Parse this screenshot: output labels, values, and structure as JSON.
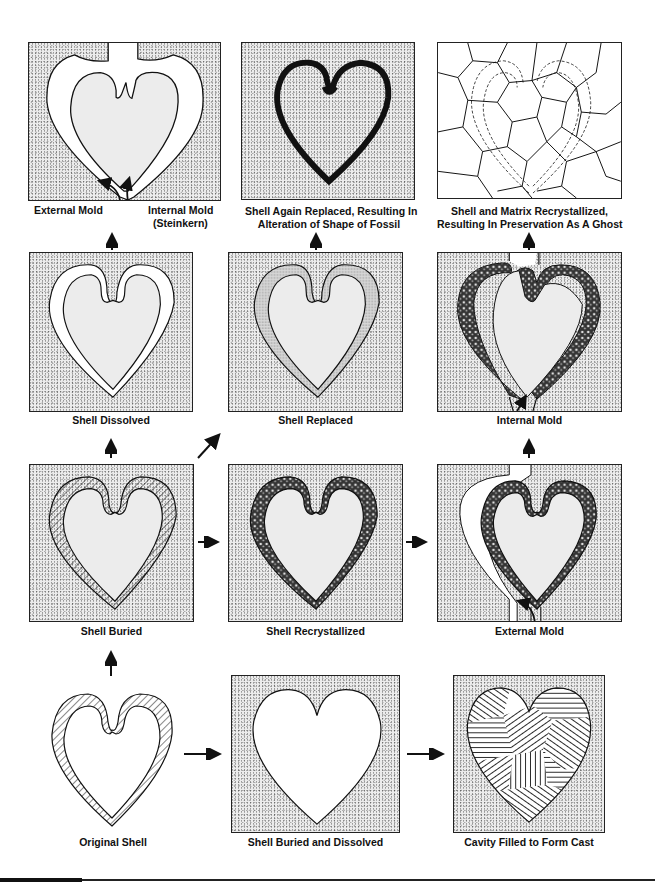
{
  "diagram": {
    "panels": [
      {
        "id": "external-internal-mold",
        "row": 1,
        "col": 1,
        "label_left": "External Mold",
        "label_right_line1": "Internal Mold",
        "label_right_line2": "(Steinkern)"
      },
      {
        "id": "shell-again-replaced",
        "row": 1,
        "col": 2,
        "label_line1": "Shell Again Replaced, Resulting In",
        "label_line2": "Alteration of Shape of Fossil"
      },
      {
        "id": "matrix-recrystallized",
        "row": 1,
        "col": 3,
        "label_line1": "Shell and Matrix Recrystallized,",
        "label_line2": "Resulting In Preservation As A Ghost"
      },
      {
        "id": "shell-dissolved",
        "row": 2,
        "col": 1,
        "label": "Shell Dissolved"
      },
      {
        "id": "shell-replaced",
        "row": 2,
        "col": 2,
        "label": "Shell Replaced"
      },
      {
        "id": "internal-mold",
        "row": 2,
        "col": 3,
        "label": "Internal Mold"
      },
      {
        "id": "shell-buried",
        "row": 3,
        "col": 1,
        "label": "Shell Buried"
      },
      {
        "id": "shell-recrystallized",
        "row": 3,
        "col": 2,
        "label": "Shell Recrystallized"
      },
      {
        "id": "external-mold",
        "row": 3,
        "col": 3,
        "label": "External Mold"
      },
      {
        "id": "original-shell",
        "row": 4,
        "col": 1,
        "label": "Original Shell"
      },
      {
        "id": "shell-buried-dissolved",
        "row": 4,
        "col": 2,
        "label": "Shell Buried and Dissolved"
      },
      {
        "id": "cavity-filled-cast",
        "row": 4,
        "col": 3,
        "label": "Cavity Filled to Form Cast"
      }
    ],
    "arrows": [
      {
        "from": "original-shell",
        "to": "shell-buried",
        "direction": "up"
      },
      {
        "from": "original-shell",
        "to": "shell-buried-dissolved",
        "direction": "right"
      },
      {
        "from": "shell-buried-dissolved",
        "to": "cavity-filled-cast",
        "direction": "right"
      },
      {
        "from": "shell-buried",
        "to": "shell-dissolved",
        "direction": "up"
      },
      {
        "from": "shell-buried",
        "to": "shell-replaced",
        "direction": "diagonal-up-right"
      },
      {
        "from": "shell-buried",
        "to": "shell-recrystallized",
        "direction": "right"
      },
      {
        "from": "shell-recrystallized",
        "to": "external-mold",
        "direction": "right"
      },
      {
        "from": "external-mold",
        "to": "internal-mold",
        "direction": "up"
      },
      {
        "from": "shell-dissolved",
        "to": "external-internal-mold",
        "direction": "up"
      },
      {
        "from": "shell-replaced",
        "to": "shell-again-replaced",
        "direction": "up"
      },
      {
        "from": "internal-mold",
        "to": "matrix-recrystallized",
        "direction": "up"
      }
    ],
    "colors": {
      "ink": "#111111",
      "sediment": "#ececec",
      "paper": "#ffffff"
    }
  }
}
